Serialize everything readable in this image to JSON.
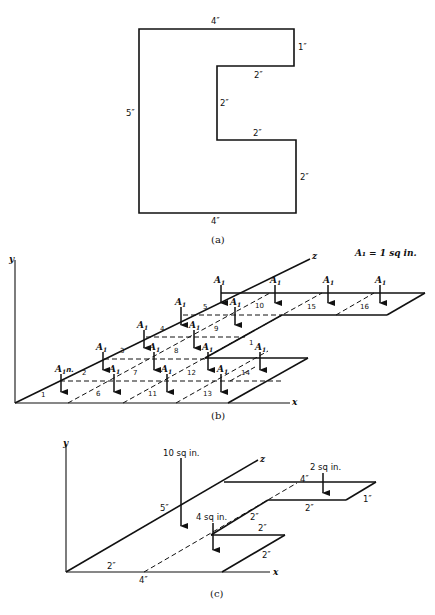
{
  "figure_a": {
    "caption": "(a)",
    "dims": {
      "top": "4″",
      "right_top": "1″",
      "notch_top": "2″",
      "notch_inner": "2″",
      "notch_bottom": "2″",
      "right_bottom": "2″",
      "left": "5″",
      "bottom": "4″"
    }
  },
  "figure_b": {
    "caption": "(b)",
    "axis_y": "y",
    "axis_x": "x",
    "axis_z": "z",
    "legend": "A₁ = 1 sq in.",
    "area_symbol": "A",
    "area_subscript": "1",
    "first_label_suffix": "n.",
    "cell_numbers": [
      "1",
      "2",
      "3",
      "4",
      "5",
      "6",
      "7",
      "8",
      "9",
      "10",
      "11",
      "12",
      "13",
      "14",
      "15",
      "16",
      "1"
    ]
  },
  "figure_c": {
    "caption": "(c)",
    "axis_y": "y",
    "axis_x": "x",
    "axis_z": "z",
    "load_large": "10 sq in.",
    "load_mid": "4 sq in.",
    "load_small": "2 sq in.",
    "dims": {
      "diag_5": "5″",
      "x_2": "2″",
      "x_4": "4″",
      "top_4": "4″",
      "top_2": "2″",
      "top_1": "1″",
      "mid_diag_2": "2″",
      "mid_top_2": "2″",
      "mid_slant_2": "2″"
    }
  }
}
